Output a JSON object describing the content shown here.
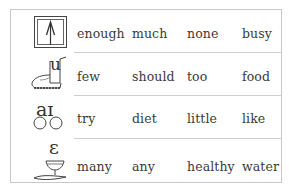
{
  "table": {
    "rows": [
      {
        "symbol": "ʌ",
        "icon": "arrow-up-box-icon",
        "words": [
          "enough",
          "much",
          "none",
          "busy"
        ]
      },
      {
        "symbol": "u",
        "icon": "boot-u-icon",
        "words": [
          "few",
          "should",
          "too",
          "food"
        ]
      },
      {
        "symbol": "aɪ",
        "icon": "bicycle-ai-icon",
        "words": [
          "try",
          "diet",
          "little",
          "like"
        ]
      },
      {
        "symbol": "ɛ",
        "icon": "egg-cup-epsilon-icon",
        "words": [
          "many",
          "any",
          "healthy",
          "water"
        ]
      }
    ]
  }
}
